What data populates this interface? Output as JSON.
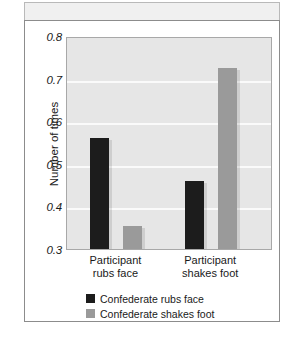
{
  "chart_data": {
    "type": "bar",
    "title": "",
    "xlabel": "",
    "ylabel": "Number of times",
    "ylim": [
      0.3,
      0.8
    ],
    "ytick_labels": [
      "0.8",
      "0.7",
      "0.6",
      "0.5",
      "0.4",
      "0.3"
    ],
    "ytick_values": [
      0.8,
      0.7,
      0.6,
      0.5,
      0.4,
      0.3
    ],
    "grid": true,
    "legend_position": "bottom-left",
    "categories": [
      "Participant rubs face",
      "Participant shakes foot"
    ],
    "category_lines": [
      [
        "Participant",
        "rubs face"
      ],
      [
        "Participant",
        "shakes foot"
      ]
    ],
    "series": [
      {
        "name": "Confederate rubs face",
        "color": "#1c1c1c",
        "values": [
          0.56,
          0.46
        ]
      },
      {
        "name": "Confederate shakes foot",
        "color": "#9a9a9a",
        "values": [
          0.355,
          0.725
        ]
      }
    ]
  },
  "legend": {
    "items": [
      {
        "label": "Confederate rubs face",
        "swatch": "dark"
      },
      {
        "label": "Confederate shakes foot",
        "swatch": "gray"
      }
    ]
  }
}
